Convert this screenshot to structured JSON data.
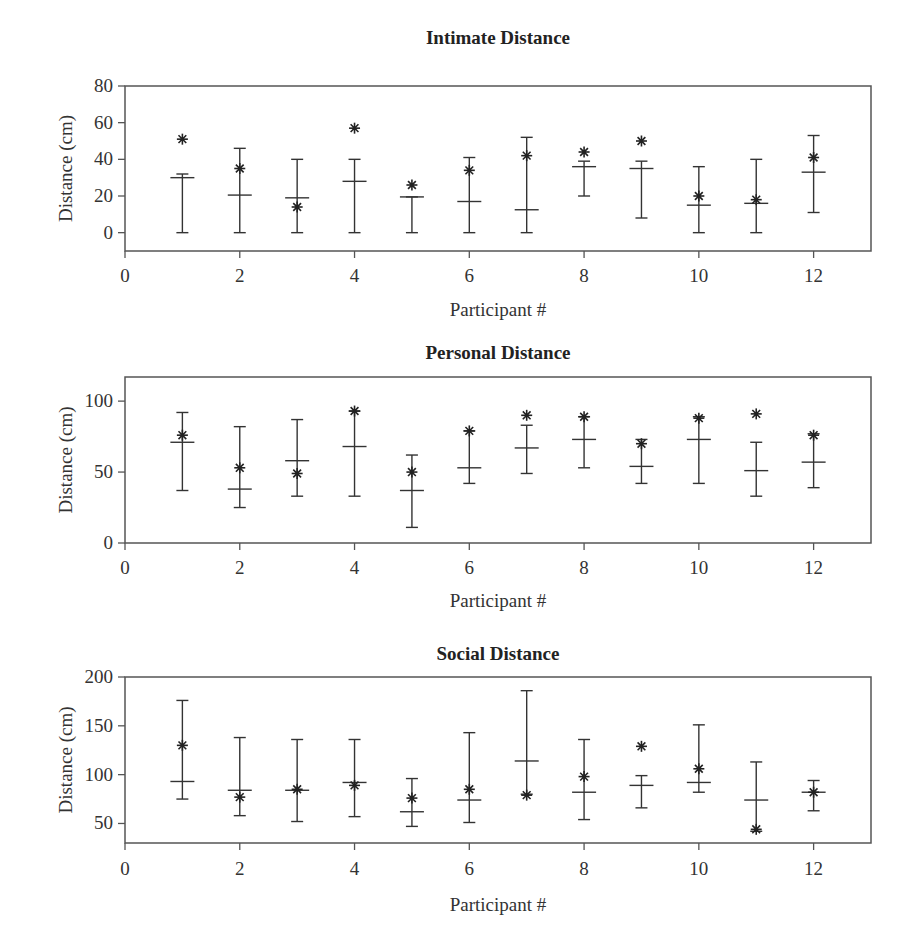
{
  "figure": {
    "panels": [
      {
        "title": "Intimate Distance",
        "xlabel": "Participant #",
        "ylabel": "Distance (cm)"
      },
      {
        "title": "Personal Distance",
        "xlabel": "Participant #",
        "ylabel": "Distance (cm)"
      },
      {
        "title": "Social Distance",
        "xlabel": "Participant #",
        "ylabel": "Distance (cm)"
      }
    ]
  },
  "chart_data": [
    {
      "type": "errorbar",
      "title": "Intimate Distance",
      "xlabel": "Participant #",
      "ylabel": "Distance (cm)",
      "xlim": [
        0,
        13
      ],
      "ylim": [
        -10,
        80
      ],
      "xticks": [
        0,
        2,
        4,
        6,
        8,
        10,
        12
      ],
      "yticks": [
        0,
        20,
        40,
        60,
        80
      ],
      "grid": false,
      "x": [
        1,
        2,
        3,
        4,
        5,
        6,
        7,
        8,
        9,
        10,
        11,
        12
      ],
      "series": [
        {
          "name": "mean",
          "marker": "horizontal-bar",
          "values": [
            30,
            20.5,
            19,
            28,
            19.5,
            17,
            12.5,
            36,
            35,
            15,
            16,
            33
          ]
        },
        {
          "name": "upper",
          "values": [
            32,
            46,
            40,
            40,
            19.5,
            41,
            52,
            39,
            39,
            36,
            40,
            53
          ]
        },
        {
          "name": "lower",
          "values": [
            0,
            0,
            0,
            0,
            0,
            0,
            0,
            20,
            8,
            0,
            0,
            11
          ]
        },
        {
          "name": "star",
          "marker": "asterisk",
          "values": [
            51,
            35,
            14,
            57,
            26,
            34,
            42,
            44,
            50,
            20,
            18,
            41
          ]
        }
      ]
    },
    {
      "type": "errorbar",
      "title": "Personal Distance",
      "xlabel": "Participant #",
      "ylabel": "Distance (cm)",
      "xlim": [
        0,
        13
      ],
      "ylim": [
        0,
        117
      ],
      "xticks": [
        0,
        2,
        4,
        6,
        8,
        10,
        12
      ],
      "yticks": [
        0,
        50,
        100
      ],
      "grid": false,
      "x": [
        1,
        2,
        3,
        4,
        5,
        6,
        7,
        8,
        9,
        10,
        11,
        12
      ],
      "series": [
        {
          "name": "mean",
          "marker": "horizontal-bar",
          "values": [
            71,
            38,
            58,
            68,
            37,
            53,
            67,
            73,
            54,
            73,
            51,
            57
          ]
        },
        {
          "name": "upper",
          "values": [
            92,
            82,
            87,
            93,
            62,
            79,
            83,
            89,
            73,
            89,
            71,
            77
          ]
        },
        {
          "name": "lower",
          "values": [
            37,
            25,
            33,
            33,
            11,
            42,
            49,
            53,
            42,
            42,
            33,
            39
          ]
        },
        {
          "name": "star",
          "marker": "asterisk",
          "values": [
            76,
            53,
            49,
            93,
            50,
            79,
            90,
            89,
            70,
            88,
            91,
            76
          ]
        }
      ]
    },
    {
      "type": "errorbar",
      "title": "Social Distance",
      "xlabel": "Participant #",
      "ylabel": "Distance (cm)",
      "xlim": [
        0,
        13
      ],
      "ylim": [
        30,
        200
      ],
      "xticks": [
        0,
        2,
        4,
        6,
        8,
        10,
        12
      ],
      "yticks": [
        50,
        100,
        150,
        200
      ],
      "grid": false,
      "x": [
        1,
        2,
        3,
        4,
        5,
        6,
        7,
        8,
        9,
        10,
        11,
        12
      ],
      "series": [
        {
          "name": "mean",
          "marker": "horizontal-bar",
          "values": [
            93,
            84,
            84,
            92,
            62,
            74,
            114,
            82,
            89,
            92,
            74,
            82
          ]
        },
        {
          "name": "upper",
          "values": [
            176,
            138,
            136,
            136,
            96,
            143,
            186,
            136,
            99,
            151,
            113,
            94
          ]
        },
        {
          "name": "lower",
          "values": [
            75,
            58,
            52,
            57,
            47,
            51,
            80,
            54,
            66,
            82,
            42,
            63
          ]
        },
        {
          "name": "star",
          "marker": "asterisk",
          "values": [
            130,
            77,
            85,
            89,
            76,
            85,
            79,
            98,
            129,
            106,
            44,
            82
          ]
        }
      ]
    }
  ]
}
